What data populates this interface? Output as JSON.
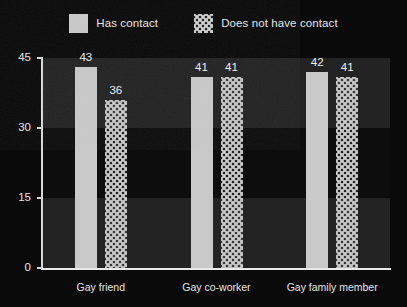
{
  "chart_data": {
    "type": "bar",
    "title": "",
    "subtitle": "",
    "xlabel": "",
    "ylabel": "",
    "categories": [
      "Gay friend",
      "Gay co-worker",
      "Gay family member"
    ],
    "series": [
      {
        "name": "Has contact",
        "values": [
          43,
          41,
          42
        ],
        "style": "solid",
        "color": "#c9c9c9"
      },
      {
        "name": "Does not have contact",
        "values": [
          36,
          41,
          41
        ],
        "style": "hatch-cross",
        "color": "#c9c9c9"
      }
    ],
    "ylim": [
      0,
      45
    ],
    "yticks": [
      0,
      15,
      30,
      45
    ],
    "ytick_labels": [
      "0",
      "15",
      "30",
      "45"
    ],
    "grid": false,
    "banded_background": true,
    "legend_position": "top-center",
    "value_labels": true,
    "background_color": "#0a0a0a",
    "band_colors": [
      "#232323",
      "#0d0d0d"
    ],
    "axis_color": "#dddddd",
    "text_color": "#e8e8e8"
  },
  "legend": {
    "items": [
      {
        "label": "Has contact",
        "swatch": "solid-square-swatch"
      },
      {
        "label": "Does not have contact",
        "swatch": "crosshatch-square-swatch"
      }
    ]
  }
}
